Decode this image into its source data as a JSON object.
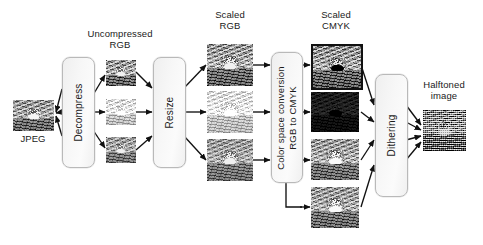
{
  "diagram": {
    "background": "#ffffff",
    "line_color": "#111111",
    "box_fill": "#f4f4f4",
    "box_border": "#b9b9b9",
    "text_color": "#1a1a1a",
    "stage_labels": {
      "source": "JPEG",
      "uncompressed": "Uncompressed\nRGB",
      "scaled_rgb": "Scaled\nRGB",
      "scaled_cmyk": "Scaled\nCMYK",
      "halftoned": "Halftoned\nimage"
    },
    "process_boxes": [
      {
        "id": "decompress",
        "label": "Decompress",
        "orientation": "vertical"
      },
      {
        "id": "resize",
        "label": "Resize",
        "orientation": "vertical"
      },
      {
        "id": "color-space-conversion",
        "label": "Color space conversion\nRGB to CMYK",
        "orientation": "vertical"
      },
      {
        "id": "dithering",
        "label": "Dithering",
        "orientation": "vertical"
      }
    ],
    "channels": {
      "rgb": [
        "red",
        "green",
        "blue"
      ],
      "cmyk": [
        "cyan",
        "magenta",
        "yellow",
        "black"
      ]
    },
    "image_nodes": [
      {
        "id": "jpeg-source",
        "group": "source",
        "caption": "JPEG"
      },
      {
        "id": "uncompressed-rgb-r",
        "group": "uncompressed-rgb",
        "channel": "red"
      },
      {
        "id": "uncompressed-rgb-g",
        "group": "uncompressed-rgb",
        "channel": "green"
      },
      {
        "id": "uncompressed-rgb-b",
        "group": "uncompressed-rgb",
        "channel": "blue"
      },
      {
        "id": "scaled-rgb-r",
        "group": "scaled-rgb",
        "channel": "red"
      },
      {
        "id": "scaled-rgb-g",
        "group": "scaled-rgb",
        "channel": "green"
      },
      {
        "id": "scaled-rgb-b",
        "group": "scaled-rgb",
        "channel": "blue"
      },
      {
        "id": "scaled-cmyk-c",
        "group": "scaled-cmyk",
        "channel": "cyan"
      },
      {
        "id": "scaled-cmyk-m",
        "group": "scaled-cmyk",
        "channel": "magenta"
      },
      {
        "id": "scaled-cmyk-y",
        "group": "scaled-cmyk",
        "channel": "yellow"
      },
      {
        "id": "scaled-cmyk-k",
        "group": "scaled-cmyk",
        "channel": "black"
      },
      {
        "id": "halftoned-output",
        "group": "halftoned",
        "caption": "Halftoned image"
      }
    ]
  }
}
